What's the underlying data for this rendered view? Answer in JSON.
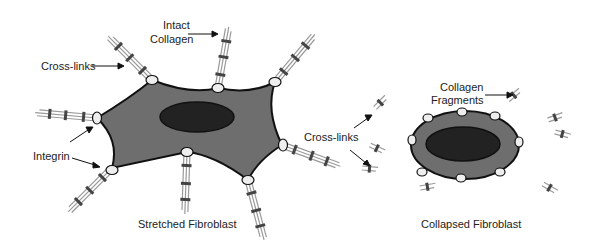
{
  "labels": {
    "intact_collagen_1": "Intact",
    "intact_collagen_2": "Collagen",
    "cross_links_left": "Cross-links",
    "integrin": "Integrin",
    "stretched_fibroblast": "Stretched Fibroblast",
    "cross_links_middle": "Cross-links",
    "collagen_fragments_1": "Collagen",
    "collagen_fragments_2": "Fragments",
    "collapsed_fibroblast": "Collapsed Fibroblast"
  },
  "colors": {
    "cell_body": "#6e6e6e",
    "nucleus": "#222222",
    "outline": "#111111",
    "integrin": "#eeeeee",
    "fiber": "#9a9a9a",
    "crosslink": "#444444"
  }
}
